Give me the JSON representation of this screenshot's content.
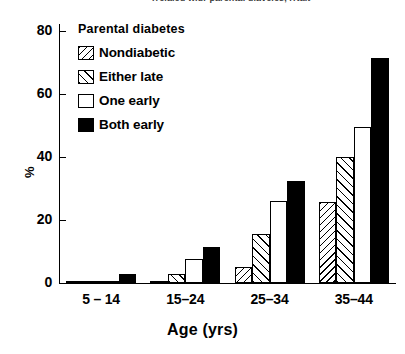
{
  "top_caption_partial": "rreiaieu wiur parental uiaveies, rrtait",
  "chart_data": {
    "type": "bar",
    "title": "",
    "subtitle": "",
    "xlabel": "Age (yrs)",
    "ylabel": "%",
    "categories": [
      "5 – 14",
      "15–24",
      "25–34",
      "35–44"
    ],
    "series": [
      {
        "name": "Nondiabetic",
        "pattern": "backslash-hatch",
        "values": [
          0.2,
          0.3,
          5.5,
          27
        ]
      },
      {
        "name": "Either late",
        "pattern": "slash-hatch",
        "values": [
          0.2,
          3,
          16.5,
          42
        ]
      },
      {
        "name": "One early",
        "pattern": "open-white",
        "values": [
          0.3,
          8,
          27.5,
          52
        ]
      },
      {
        "name": "Both early",
        "pattern": "solid-black",
        "values": [
          3,
          12,
          34,
          75
        ]
      }
    ],
    "ylim": [
      0,
      85
    ],
    "yticks": [
      0,
      20,
      40,
      60,
      80
    ],
    "ytick_labels": [
      "0",
      "20",
      "40",
      "60",
      "80"
    ],
    "grid": false,
    "legend_position": "upper-left-inside",
    "legend_title": "Parental diabetes",
    "colors": {
      "ink": "#000000",
      "background": "#ffffff"
    }
  },
  "axes": {
    "y_title": "%",
    "x_title": "Age (yrs)",
    "y_ticks": [
      {
        "label": "80",
        "value": 80
      },
      {
        "label": "60",
        "value": 60
      },
      {
        "label": "40",
        "value": 40
      },
      {
        "label": "20",
        "value": 20
      },
      {
        "label": "0",
        "value": 0
      }
    ],
    "x_ticks": [
      {
        "label": "5 – 14"
      },
      {
        "label": "15–24"
      },
      {
        "label": "25–34"
      },
      {
        "label": "35–44"
      }
    ]
  },
  "legend": {
    "title": "Parental diabetes",
    "items": [
      {
        "label": "Nondiabetic"
      },
      {
        "label": "Either late"
      },
      {
        "label": "One early"
      },
      {
        "label": "Both early"
      }
    ]
  }
}
